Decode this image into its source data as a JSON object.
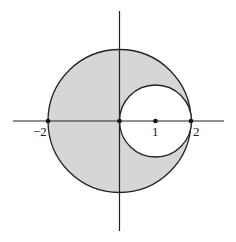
{
  "diagram": {
    "fill_color": "#d6d6d6",
    "stroke_color": "#222222",
    "labels": {
      "neg_two": "−2",
      "one": "1",
      "two": "2"
    },
    "points": [
      {
        "name": "x=-2",
        "x": -2,
        "y": 0
      },
      {
        "name": "origin",
        "x": 0,
        "y": 0
      },
      {
        "name": "x=1",
        "x": 1,
        "y": 0
      },
      {
        "name": "x=2",
        "x": 2,
        "y": 0
      }
    ],
    "circles": [
      {
        "name": "large",
        "center": [
          0,
          0
        ],
        "radius": 2
      },
      {
        "name": "small",
        "center": [
          1,
          0
        ],
        "radius": 1
      }
    ]
  }
}
